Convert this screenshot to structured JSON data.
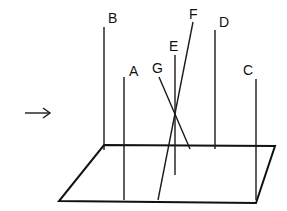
{
  "diagram": {
    "arrow": {
      "glyph": "→",
      "x": 25,
      "y": 113,
      "direction": "right"
    },
    "plane": {
      "points": [
        [
          104,
          145
        ],
        [
          275,
          146
        ],
        [
          256,
          203
        ],
        [
          59,
          201
        ]
      ]
    },
    "rods": [
      {
        "label": "A",
        "x1": 124,
        "y1": 77,
        "x2": 124,
        "y2": 200,
        "label_x": 129,
        "label_y": 76
      },
      {
        "label": "B",
        "x1": 104,
        "y1": 27,
        "x2": 104,
        "y2": 150,
        "label_x": 108,
        "label_y": 23
      },
      {
        "label": "C",
        "x1": 256,
        "y1": 79,
        "x2": 256,
        "y2": 200,
        "label_x": 243,
        "label_y": 75
      },
      {
        "label": "D",
        "x1": 215,
        "y1": 30,
        "x2": 215,
        "y2": 149,
        "label_x": 219,
        "label_y": 27
      },
      {
        "label": "E",
        "x1": 175,
        "y1": 55,
        "x2": 175,
        "y2": 175,
        "label_x": 169,
        "label_y": 51
      },
      {
        "label": "F",
        "x1": 193,
        "y1": 22,
        "x2": 158,
        "y2": 200,
        "label_x": 189,
        "label_y": 19
      },
      {
        "label": "G",
        "x1": 159,
        "y1": 77,
        "x2": 190,
        "y2": 149,
        "label_x": 152,
        "label_y": 73
      }
    ]
  }
}
